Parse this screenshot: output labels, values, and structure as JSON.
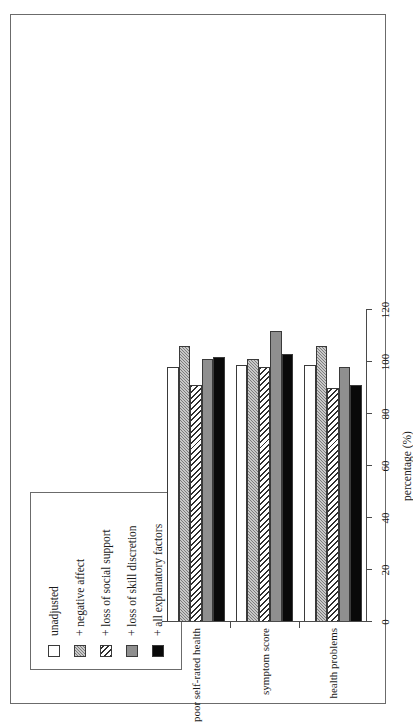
{
  "page": {
    "header_text": ""
  },
  "chart_data": {
    "type": "bar",
    "orientation": "vertical-bars-printed-sideways",
    "title": "",
    "xlabel": "",
    "ylabel": "percentage (%)",
    "ylim": [
      0,
      120
    ],
    "yticks": [
      0,
      20,
      40,
      60,
      80,
      100,
      120
    ],
    "ytick_labels": [
      "0",
      "20",
      "40",
      "60",
      "80",
      "100",
      "120"
    ],
    "grid": false,
    "legend_position": "top-left",
    "categories": [
      "poor self-rated health",
      "symptom score",
      "health problems"
    ],
    "series": [
      {
        "name": "unadjusted",
        "pattern": "open",
        "color": "#ffffff",
        "values": [
          98,
          99,
          99
        ]
      },
      {
        "name": "+ negative affect",
        "pattern": "dots",
        "color": "#7d7d7d",
        "values": [
          106,
          101,
          106
        ]
      },
      {
        "name": "+ loss of social support",
        "pattern": "hatch",
        "color": "#ffffff",
        "values": [
          91,
          98,
          90
        ]
      },
      {
        "name": "+ loss of skill discretion",
        "pattern": "solid-grey",
        "color": "#8f8f8f",
        "values": [
          101,
          112,
          98
        ]
      },
      {
        "name": "+ all explanatory factors",
        "pattern": "solid-black",
        "color": "#090909",
        "values": [
          102,
          103,
          91
        ]
      }
    ]
  },
  "legend": {
    "items": [
      {
        "label": "unadjusted"
      },
      {
        "label": "+ negative affect"
      },
      {
        "label": "+ loss of social support"
      },
      {
        "label": "+ loss of skill discretion"
      },
      {
        "label": "+ all explanatory factors"
      }
    ]
  }
}
